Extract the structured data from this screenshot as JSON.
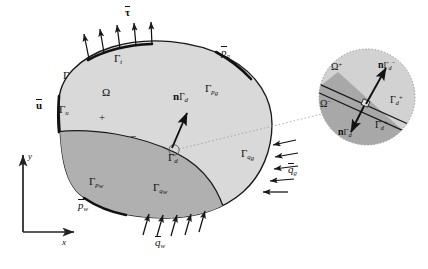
{
  "figure": {
    "type": "mechanics-domain-diagram",
    "title_visible": false,
    "colors": {
      "body_upper_fill": "#d9d9d9",
      "body_lower_fill": "#b0b0b0",
      "inset_upper_fill": "#d2d2d2",
      "inset_lower_fill": "#a8a8a8",
      "outline": "#1a1a1a",
      "background": "#ffffff",
      "leader_line": "#8a8a8a"
    }
  },
  "axes": {
    "x_label": "x",
    "y_label": "y"
  },
  "main_body": {
    "domain_label": "Ω",
    "boundary_label": "Γ",
    "plus_sign": "+",
    "minus_sign": "−",
    "discontinuity_label_gamma": "Γ",
    "discontinuity_label_sub": "d",
    "normal_vector": {
      "bold": "n",
      "gamma": "Γ",
      "sub": "d"
    }
  },
  "boundaries": [
    {
      "name": "traction-boundary",
      "gamma": "Γ",
      "sub": "t",
      "x": 123,
      "y": 56
    },
    {
      "name": "displacement-boundary",
      "gamma": "Γ",
      "sub": "u",
      "x": 40,
      "y": 108
    },
    {
      "name": "gas-pressure-boundary",
      "gamma": "Γ",
      "sub": "p",
      "sub2": "g",
      "x": 213,
      "y": 88
    },
    {
      "name": "gas-flux-boundary",
      "gamma": "Γ",
      "sub": "q",
      "sub2": "g",
      "x": 246,
      "y": 151
    },
    {
      "name": "water-flux-boundary",
      "gamma": "Γ",
      "sub": "q",
      "sub2": "w",
      "x": 162,
      "y": 183
    },
    {
      "name": "water-pressure-boundary",
      "gamma": "Γ",
      "sub": "p",
      "sub2": "w",
      "x": 97,
      "y": 179
    }
  ],
  "loads": [
    {
      "name": "traction-load",
      "symbol": "τ",
      "overbar": true,
      "bold": true,
      "x": 129,
      "y": 8,
      "arrows": 5,
      "direction": "up-out"
    },
    {
      "name": "displacement-load",
      "symbol": "u",
      "overbar": true,
      "bold": true,
      "x": 11,
      "y": 101,
      "arrows": 0,
      "direction": "none"
    },
    {
      "name": "gas-pressure-load",
      "symbol": "p",
      "overbar": true,
      "sub": "g",
      "x": 222,
      "y": 48,
      "arrows": 0,
      "direction": "none"
    },
    {
      "name": "water-pressure-load",
      "symbol": "p",
      "overbar": true,
      "sub": "w",
      "x": 80,
      "y": 201,
      "arrows": 0,
      "direction": "none"
    },
    {
      "name": "gas-flux-load",
      "symbol": "q",
      "overbar": true,
      "sub": "g",
      "x": 290,
      "y": 165,
      "arrows": 5,
      "direction": "in-left"
    },
    {
      "name": "water-flux-load",
      "symbol": "q",
      "overbar": true,
      "sub": "w",
      "x": 157,
      "y": 237,
      "arrows": 5,
      "direction": "up-in"
    }
  ],
  "inset": {
    "name": "magnified-discontinuity",
    "upper_domain": {
      "omega": "Ω",
      "sup": "+"
    },
    "lower_domain": {
      "omega": "Ω",
      "sup": "−"
    },
    "normal_upper": {
      "bold": "n",
      "gamma": "Γ",
      "sub": "d",
      "sup": "−"
    },
    "normal_lower": {
      "bold": "n",
      "gamma": "Γ",
      "sub": "d",
      "sup": "−"
    },
    "face_upper": {
      "gamma": "Γ",
      "sub": "d",
      "sup": "+"
    },
    "face_lower": {
      "gamma": "Γ",
      "sub": "d",
      "sup": "+"
    }
  }
}
